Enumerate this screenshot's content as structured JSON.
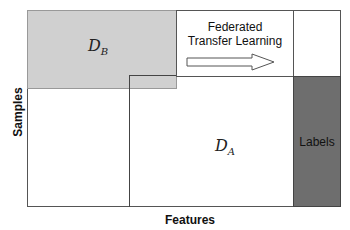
{
  "diagram": {
    "axes": {
      "x_label": "Features",
      "y_label": "Samples"
    },
    "parties": {
      "db": {
        "name": "D",
        "sub": "B",
        "fill": "#d0d0d0"
      },
      "da": {
        "name": "D",
        "sub": "A",
        "fill": "#ffffff"
      }
    },
    "labels_block": {
      "text": "Labels",
      "fill": "#6e6e6e"
    },
    "arrow": {
      "line1": "Federated",
      "line2": "Transfer Learning"
    }
  }
}
